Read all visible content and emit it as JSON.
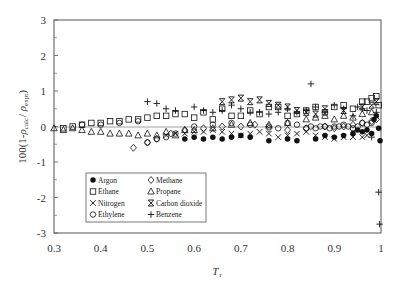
{
  "chart_data": {
    "type": "scatter",
    "title": "",
    "xlabel": "T_r",
    "xlabel_main": "T",
    "xlabel_sub": "r",
    "ylabel": "100(1-ρ_calc/ρ_expt)",
    "ylabel_prefix": "100(1-",
    "ylabel_rho1": "ρ",
    "ylabel_sub1": "calc",
    "ylabel_mid": "/ ",
    "ylabel_rho2": "ρ",
    "ylabel_sub2": "expt",
    "ylabel_suffix": ")",
    "xlim": [
      0.3,
      1.0
    ],
    "ylim": [
      -3,
      3
    ],
    "xticks": [
      "0.3",
      "0.4",
      "0.5",
      "0.6",
      "0.7",
      "0.8",
      "0.9",
      "1"
    ],
    "yticks": [
      "3",
      "2",
      "1",
      "0",
      "-1",
      "-2",
      "-3"
    ],
    "grid": false,
    "zero_line": true,
    "legend_position": "lower-left inside",
    "series": [
      {
        "name": "Argon",
        "marker": "filled-circle",
        "x": [
          0.58,
          0.6,
          0.62,
          0.64,
          0.66,
          0.68,
          0.7,
          0.72,
          0.76,
          0.8,
          0.82,
          0.86,
          0.88,
          0.9,
          0.92,
          0.94,
          0.95,
          0.96,
          0.97,
          0.98,
          0.985,
          0.99,
          0.995,
          0.998
        ],
        "y": [
          -0.35,
          -0.3,
          -0.35,
          -0.3,
          -0.35,
          -0.3,
          -0.25,
          -0.3,
          -0.4,
          -0.35,
          -0.4,
          -0.35,
          -0.25,
          -0.3,
          -0.25,
          -0.2,
          -0.1,
          -0.15,
          -0.1,
          -0.2,
          0.2,
          0.3,
          -0.05,
          -0.4
        ]
      },
      {
        "name": "Ethane",
        "marker": "open-square",
        "x": [
          0.32,
          0.34,
          0.36,
          0.38,
          0.4,
          0.42,
          0.44,
          0.46,
          0.48,
          0.5,
          0.52,
          0.54,
          0.56,
          0.58,
          0.6,
          0.62,
          0.64,
          0.66,
          0.68,
          0.7,
          0.72,
          0.74,
          0.76,
          0.78,
          0.8,
          0.82,
          0.84,
          0.86,
          0.88,
          0.9,
          0.92,
          0.94,
          0.96,
          0.97,
          0.98,
          0.99,
          0.995
        ],
        "y": [
          -0.05,
          0.0,
          0.05,
          0.1,
          0.1,
          0.15,
          0.15,
          0.2,
          0.2,
          0.25,
          0.3,
          0.3,
          0.35,
          0.35,
          0.25,
          0.4,
          0.2,
          0.5,
          0.3,
          0.3,
          0.45,
          0.35,
          0.55,
          0.55,
          0.3,
          0.35,
          0.45,
          0.55,
          0.4,
          0.55,
          0.6,
          0.5,
          0.7,
          0.7,
          0.8,
          0.85,
          0.6
        ]
      },
      {
        "name": "Nitrogen",
        "marker": "x-cross",
        "x": [
          0.54,
          0.56,
          0.58,
          0.6,
          0.62,
          0.64,
          0.66,
          0.68,
          0.7,
          0.72,
          0.74,
          0.76,
          0.78,
          0.8,
          0.82,
          0.84,
          0.86,
          0.88,
          0.9,
          0.92,
          0.94,
          0.96,
          0.97
        ],
        "y": [
          -0.25,
          -0.2,
          -0.2,
          -0.15,
          -0.15,
          -0.1,
          -0.15,
          -0.2,
          -0.25,
          -0.2,
          -0.15,
          -0.2,
          -0.3,
          -0.25,
          -0.2,
          -0.15,
          -0.25,
          -0.3,
          -0.35,
          -0.3,
          -0.3,
          -0.3,
          -0.25
        ]
      },
      {
        "name": "Ethylene",
        "marker": "open-circle",
        "x": [
          0.36,
          0.4,
          0.44,
          0.48,
          0.5,
          0.52,
          0.54,
          0.56,
          0.6,
          0.64,
          0.68,
          0.72,
          0.76,
          0.78,
          0.8,
          0.82,
          0.84,
          0.85,
          0.86,
          0.87,
          0.88,
          0.89,
          0.9,
          0.91,
          0.92,
          0.93,
          0.94,
          0.95,
          0.96,
          0.97,
          0.98
        ],
        "y": [
          0.05,
          0.05,
          0.1,
          0.15,
          -0.45,
          -0.35,
          -0.3,
          -0.2,
          0.0,
          0.05,
          0.1,
          0.05,
          0.0,
          -0.05,
          0.1,
          0.05,
          -0.05,
          0.0,
          -0.05,
          0.0,
          0.0,
          -0.05,
          0.0,
          0.0,
          0.05,
          0.0,
          -0.05,
          0.0,
          0.1,
          0.05,
          0.1
        ]
      },
      {
        "name": "Methane",
        "marker": "open-diamond",
        "x": [
          0.47,
          0.5,
          0.52,
          0.55,
          0.58,
          0.62,
          0.66,
          0.7,
          0.73,
          0.76,
          0.8,
          0.84,
          0.88,
          0.9,
          0.92,
          0.94,
          0.96,
          0.98,
          0.99
        ],
        "y": [
          -0.6,
          -0.45,
          -0.35,
          -0.2,
          -0.1,
          -0.05,
          0.0,
          0.0,
          0.05,
          -0.05,
          -0.1,
          -0.05,
          0.0,
          -0.05,
          0.0,
          0.05,
          0.1,
          0.15,
          0.2
        ]
      },
      {
        "name": "Propane",
        "marker": "open-triangle",
        "x": [
          0.3,
          0.32,
          0.34,
          0.36,
          0.38,
          0.4,
          0.42,
          0.44,
          0.46,
          0.48,
          0.5,
          0.52,
          0.54,
          0.56,
          0.58,
          0.6,
          0.64,
          0.68,
          0.72,
          0.76,
          0.8,
          0.84,
          0.86,
          0.88,
          0.9,
          0.92,
          0.94,
          0.96,
          0.98
        ],
        "y": [
          -0.05,
          -0.1,
          -0.05,
          -0.1,
          -0.15,
          -0.15,
          -0.2,
          -0.2,
          -0.2,
          -0.25,
          -0.2,
          -0.25,
          -0.15,
          -0.25,
          -0.1,
          -0.1,
          -0.05,
          0.05,
          0.1,
          0.05,
          0.1,
          0.2,
          0.25,
          0.3,
          0.2,
          0.3,
          0.25,
          0.35,
          0.4
        ]
      },
      {
        "name": "Carbon dioxide",
        "marker": "hourglass",
        "x": [
          0.66,
          0.68,
          0.7,
          0.72,
          0.74,
          0.76,
          0.78,
          0.8,
          0.82,
          0.84,
          0.86,
          0.88,
          0.92,
          0.96,
          0.98,
          0.99
        ],
        "y": [
          0.7,
          0.75,
          0.8,
          0.7,
          0.75,
          0.65,
          0.6,
          0.55,
          0.45,
          0.4,
          0.35,
          0.5,
          0.45,
          0.55,
          0.6,
          0.7
        ]
      },
      {
        "name": "Benzene",
        "marker": "plus",
        "x": [
          0.5,
          0.52,
          0.54,
          0.56,
          0.6,
          0.62,
          0.64,
          0.66,
          0.68,
          0.7,
          0.72,
          0.74,
          0.76,
          0.78,
          0.8,
          0.82,
          0.84,
          0.85,
          0.86,
          0.88,
          0.9,
          0.92,
          0.94,
          0.95,
          0.96,
          0.97,
          0.98,
          0.99,
          0.995,
          0.997
        ],
        "y": [
          0.7,
          0.65,
          0.5,
          0.45,
          0.55,
          0.45,
          0.4,
          0.45,
          0.6,
          0.5,
          0.4,
          0.4,
          0.35,
          0.4,
          0.5,
          0.4,
          0.45,
          1.2,
          0.55,
          0.4,
          0.6,
          0.5,
          0.3,
          0.55,
          0.5,
          0.45,
          -0.3,
          0.4,
          -1.85,
          -2.75
        ]
      }
    ]
  }
}
